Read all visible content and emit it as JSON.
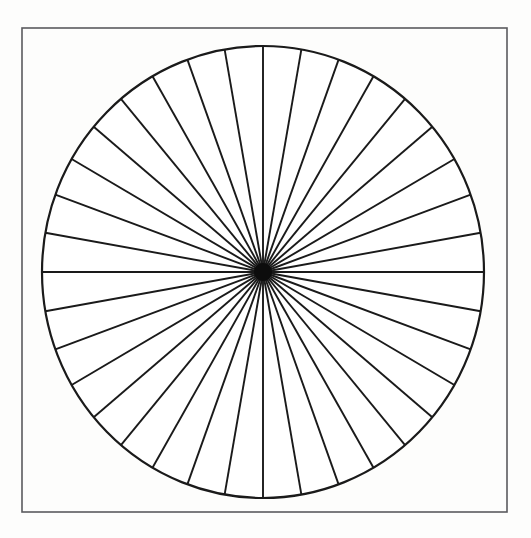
{
  "figure": {
    "title": "Circle divided into radial sectors",
    "description": "A thin rectangular frame enclosing a large circle subdivided by straight radial lines converging at the circle centre.",
    "canvas": {
      "width": 531,
      "height": 538,
      "background_color": "#fdfdfc"
    },
    "frame": {
      "name": "outer-frame",
      "x": 22,
      "y": 28,
      "width": 485,
      "height": 484,
      "stroke_color": "#5a5a5e",
      "stroke_width": 1.6,
      "fill": "none"
    },
    "circle": {
      "name": "sector-circle",
      "center_x": 263,
      "center_y": 272,
      "radius_x": 221,
      "radius_y": 226,
      "stroke_color": "#1a1a1a",
      "stroke_width": 2.2,
      "fill": "#ffffff"
    },
    "sectors": {
      "count": 36,
      "angle_step_degrees": 10,
      "start_angle_degrees": 0,
      "spoke_stroke_color": "#1a1a1a",
      "spoke_stroke_width": 1.9,
      "hub": {
        "name": "center-hub",
        "radius": 9,
        "color": "#0d0d0d"
      }
    },
    "chart_data": {
      "type": "pie",
      "title": "Circle divided into 36 equal radial sectors",
      "subtitle": "",
      "xlabel": "",
      "ylabel": "",
      "legend_position": "none",
      "grid": false,
      "categories": [
        "S1",
        "S2",
        "S3",
        "S4",
        "S5",
        "S6",
        "S7",
        "S8",
        "S9",
        "S10",
        "S11",
        "S12",
        "S13",
        "S14",
        "S15",
        "S16",
        "S17",
        "S18",
        "S19",
        "S20",
        "S21",
        "S22",
        "S23",
        "S24",
        "S25",
        "S26",
        "S27",
        "S28",
        "S29",
        "S30",
        "S31",
        "S32",
        "S33",
        "S34",
        "S35",
        "S36"
      ],
      "values": [
        10,
        10,
        10,
        10,
        10,
        10,
        10,
        10,
        10,
        10,
        10,
        10,
        10,
        10,
        10,
        10,
        10,
        10,
        10,
        10,
        10,
        10,
        10,
        10,
        10,
        10,
        10,
        10,
        10,
        10,
        10,
        10,
        10,
        10,
        10,
        10
      ],
      "value_unit": "degrees",
      "total_degrees": 360,
      "slice_fill": "#ffffff",
      "slice_stroke": "#1a1a1a",
      "annotations": []
    }
  }
}
